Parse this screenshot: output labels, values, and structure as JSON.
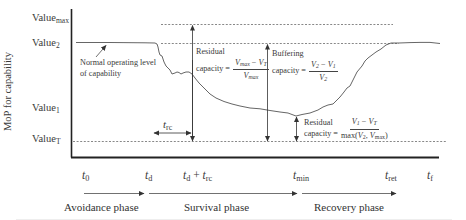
{
  "diagram": {
    "y_axis_label": "MoP for capability",
    "y_levels": [
      {
        "id": "max",
        "base": "Value",
        "sub": "max"
      },
      {
        "id": "v2",
        "base": "Value",
        "sub": "2"
      },
      {
        "id": "v1",
        "base": "Value",
        "sub": "1"
      },
      {
        "id": "vT",
        "base": "Value",
        "sub": "T"
      }
    ],
    "annotation_normal": "Normal operating level of capability",
    "annotation_normal_line1": "Normal operating level",
    "annotation_normal_line2": "of capability",
    "time_marks": [
      {
        "id": "t0",
        "base": "t",
        "sub": "0"
      },
      {
        "id": "td",
        "base": "t",
        "sub": "d"
      },
      {
        "id": "td_trc",
        "base": "t",
        "sub": "d",
        "plus": "+",
        "base2": "t",
        "sub2": "rc"
      },
      {
        "id": "tmin",
        "base": "t",
        "sub": "min"
      },
      {
        "id": "tret",
        "base": "t",
        "sub": "ret"
      },
      {
        "id": "tf",
        "base": "t",
        "sub": "f"
      }
    ],
    "trc_label": {
      "base": "t",
      "sub": "rc"
    },
    "phases": [
      "Avoidance phase",
      "Survival phase",
      "Recovery phase"
    ],
    "residual_capacity_1": {
      "line1": "Residual",
      "line2": "capacity =",
      "numerator": "V_max − V_T",
      "num_a": "V",
      "num_a_sub": "max",
      "minus": "−",
      "num_b": "V",
      "num_b_sub": "T",
      "den": "V",
      "den_sub": "max"
    },
    "buffering_capacity": {
      "line1": "Buffering",
      "line2": "capacity =",
      "num_a": "V",
      "num_a_sub": "2",
      "minus": "−",
      "num_b": "V",
      "num_b_sub": "1",
      "den": "V",
      "den_sub": "2"
    },
    "residual_capacity_2": {
      "line1": "Residual",
      "line2": "capacity =",
      "num_a": "V",
      "num_a_sub": "1",
      "minus": "−",
      "num_b": "V",
      "num_b_sub": "T",
      "den_prefix": "max(",
      "den_a": "V",
      "den_a_sub": "2",
      "den_comma": ", ",
      "den_b": "V",
      "den_b_sub": "max",
      "den_suffix": ")"
    }
  }
}
